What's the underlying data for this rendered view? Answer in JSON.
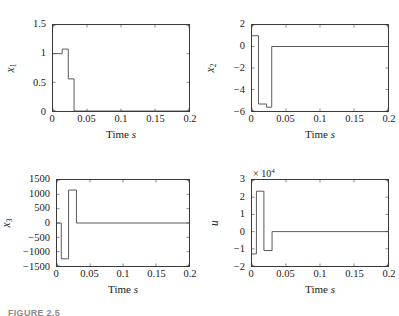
{
  "figure": {
    "caption": "FIGURE 2.5",
    "columns": 2,
    "rows": 2
  },
  "chart_data": [
    {
      "type": "line",
      "title": "",
      "panel_index": 0,
      "ylabel": "x_1",
      "ylabel_text": "x",
      "ylabel_sub": "1",
      "xlabel": "Time s",
      "xlim": [
        0,
        0.2
      ],
      "ylim": [
        0,
        1.5
      ],
      "xticks": [
        0,
        0.05,
        0.1,
        0.15,
        0.2
      ],
      "xticklabels": [
        "0",
        "0.05",
        "0.1",
        "0.15",
        "0.2"
      ],
      "yticks": [
        0,
        0.5,
        1,
        1.5
      ],
      "yticklabels": [
        "0",
        "0.5",
        "1",
        "1.5"
      ],
      "grid": false,
      "legend": "none",
      "step_style": "post",
      "x": [
        0,
        0.0105,
        0.0135,
        0.019,
        0.0225,
        0.031,
        0.2
      ],
      "y": [
        1.0,
        1.0,
        1.08,
        1.08,
        0.56,
        0.0,
        0.0
      ]
    },
    {
      "type": "line",
      "title": "",
      "panel_index": 1,
      "ylabel": "x_2",
      "ylabel_text": "x",
      "ylabel_sub": "2",
      "xlabel": "Time s",
      "xlim": [
        0,
        0.2
      ],
      "ylim": [
        -6,
        2
      ],
      "xticks": [
        0,
        0.05,
        0.1,
        0.15,
        0.2
      ],
      "xticklabels": [
        "0",
        "0.05",
        "0.1",
        "0.15",
        "0.2"
      ],
      "yticks": [
        -6,
        -4,
        -2,
        0,
        2
      ],
      "yticklabels": [
        "-6",
        "-4",
        "-2",
        "0",
        "2"
      ],
      "grid": false,
      "legend": "none",
      "step_style": "post",
      "x": [
        0,
        0.0095,
        0.0215,
        0.029,
        0.2
      ],
      "y": [
        1.0,
        -5.35,
        -5.65,
        0.0,
        0.0
      ]
    },
    {
      "type": "line",
      "title": "",
      "panel_index": 2,
      "ylabel": "x_3",
      "ylabel_text": "x",
      "ylabel_sub": "3",
      "xlabel": "Time s",
      "xlim": [
        0,
        0.2
      ],
      "ylim": [
        -1500,
        1500
      ],
      "xticks": [
        0,
        0.05,
        0.1,
        0.15,
        0.2
      ],
      "xticklabels": [
        "0",
        "0.05",
        "0.1",
        "0.15",
        "0.2"
      ],
      "yticks": [
        -1500,
        -1000,
        -500,
        0,
        500,
        1000,
        1500
      ],
      "yticklabels": [
        "-1500",
        "-1000",
        "-500",
        "0",
        "500",
        "1000",
        "1500"
      ],
      "grid": false,
      "legend": "none",
      "step_style": "post",
      "x": [
        0,
        0.0065,
        0.0175,
        0.0295,
        0.2
      ],
      "y": [
        0.0,
        -1250.0,
        1150.0,
        0.0,
        0.0
      ]
    },
    {
      "type": "line",
      "title": "",
      "panel_index": 3,
      "ylabel": "u",
      "ylabel_text": "u",
      "ylabel_sub": "",
      "xlabel": "Time s",
      "exponent_label": "× 10",
      "exponent_power": "4",
      "xlim": [
        0,
        0.2
      ],
      "ylim": [
        -20000,
        30000
      ],
      "xticks": [
        0,
        0.05,
        0.1,
        0.15,
        0.2
      ],
      "xticklabels": [
        "0",
        "0.05",
        "0.1",
        "0.15",
        "0.2"
      ],
      "yticks": [
        -20000,
        -10000,
        0,
        10000,
        20000,
        30000
      ],
      "yticklabels": [
        "-2",
        "-1",
        "0",
        "1",
        "2",
        "3"
      ],
      "grid": false,
      "legend": "none",
      "step_style": "post",
      "x": [
        0,
        0.0065,
        0.0175,
        0.0295,
        0.2
      ],
      "y": [
        -13000,
        23500,
        -11000,
        0,
        0
      ]
    }
  ]
}
